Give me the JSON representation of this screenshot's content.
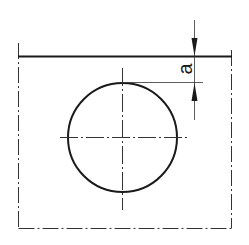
{
  "diagram": {
    "type": "technical-drawing",
    "dimension_label": "a",
    "colors": {
      "line": "#1a1a1a",
      "background": "#ffffff"
    }
  }
}
